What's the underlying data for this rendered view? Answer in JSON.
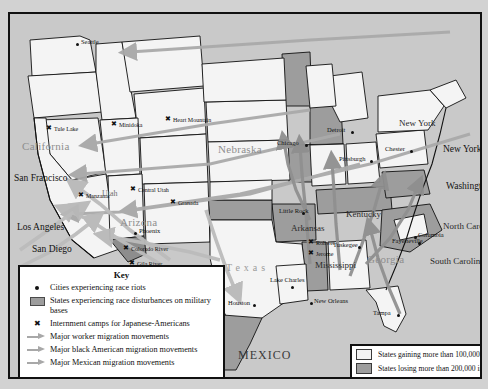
{
  "map": {
    "title": "United States wartime migration and racial unrest map",
    "background_color": "#c9c9c9",
    "border_color": "#111111",
    "state_fill_light": "#f2f2f2",
    "state_fill_gain": "#f2f2f2",
    "state_fill_loss": "#9d9d9d",
    "ocean_color": "#c9c9c9",
    "arrow_worker_color": "#a8a8a8",
    "arrow_black_color": "#8f8f8f",
    "arrow_mexican_color": "#b5b5b5"
  },
  "key": {
    "title": "Key",
    "items": [
      {
        "symbol": "filled-square",
        "label": "Cities experiencing race riots"
      },
      {
        "symbol": "gray-swatch",
        "label": "States experiencing race disturbances on military bases"
      },
      {
        "symbol": "star-square",
        "label": "Internment camps for Japanese-Americans"
      },
      {
        "symbol": "arrow",
        "label": "Major worker migration movements"
      },
      {
        "symbol": "arrow",
        "label": "Major black American migration movements"
      },
      {
        "symbol": "arrow",
        "label": "Major Mexican migration movements"
      }
    ]
  },
  "population_legend": {
    "items": [
      {
        "swatch_color": "#f2f2f2",
        "label": "States gaining more than 100,000 in population"
      },
      {
        "swatch_color": "#9d9d9d",
        "label": "States losing more than 200,000 in population"
      }
    ]
  },
  "cities": [
    {
      "name": "Seattle",
      "x": 66,
      "y": 29,
      "size": "small",
      "dot": true,
      "dx": 5,
      "dy": -4
    },
    {
      "name": "San Francisco",
      "x": 4,
      "y": 160,
      "size": "big",
      "dot": false,
      "dx": 0,
      "dy": 0
    },
    {
      "name": "Los Angeles",
      "x": 7,
      "y": 209,
      "size": "big",
      "dot": false,
      "dx": 0,
      "dy": 0
    },
    {
      "name": "San Diego",
      "x": 22,
      "y": 231,
      "size": "big",
      "dot": false,
      "dx": 0,
      "dy": 0
    },
    {
      "name": "Phoenix",
      "x": 124,
      "y": 218,
      "size": "small",
      "dot": true,
      "dx": 5,
      "dy": -4
    },
    {
      "name": "Chicago",
      "x": 295,
      "y": 130,
      "size": "small",
      "dot": true,
      "dx": -28,
      "dy": -4
    },
    {
      "name": "Detroit",
      "x": 341,
      "y": 117,
      "size": "small",
      "dot": true,
      "dx": -24,
      "dy": -4
    },
    {
      "name": "Pittsburgh",
      "x": 360,
      "y": 146,
      "size": "small",
      "dot": true,
      "dx": -31,
      "dy": -4
    },
    {
      "name": "Chester",
      "x": 400,
      "y": 136,
      "size": "small",
      "dot": true,
      "dx": -25,
      "dy": -4
    },
    {
      "name": "New York",
      "x": 433,
      "y": 131,
      "size": "big",
      "dot": false,
      "dx": 0,
      "dy": 0
    },
    {
      "name": "Washington",
      "x": 436,
      "y": 168,
      "size": "big",
      "dot": false,
      "dx": 0,
      "dy": 0
    },
    {
      "name": "Fayetteville",
      "x": 408,
      "y": 228,
      "size": "small",
      "dot": true,
      "dx": -26,
      "dy": -4
    },
    {
      "name": "Columbia",
      "x": 404,
      "y": 222,
      "size": "small",
      "dot": true,
      "dx": 4,
      "dy": -4
    },
    {
      "name": "Little Rock",
      "x": 292,
      "y": 198,
      "size": "small",
      "dot": true,
      "dx": -23,
      "dy": -4
    },
    {
      "name": "Tuskegee",
      "x": 348,
      "y": 232,
      "size": "small",
      "dot": true,
      "dx": -25,
      "dy": -4
    },
    {
      "name": "Lake Charles",
      "x": 281,
      "y": 272,
      "size": "small",
      "dot": true,
      "dx": -21,
      "dy": -9
    },
    {
      "name": "New Orleans",
      "x": 300,
      "y": 288,
      "size": "small",
      "dot": true,
      "dx": 4,
      "dy": -4
    },
    {
      "name": "Houston",
      "x": 243,
      "y": 290,
      "size": "small",
      "dot": true,
      "dx": -25,
      "dy": -4
    },
    {
      "name": "Tampa",
      "x": 387,
      "y": 300,
      "size": "small",
      "dot": true,
      "dx": -24,
      "dy": -4
    }
  ],
  "internment_camps": [
    {
      "name": "Tule Lake",
      "x": 36,
      "y": 111
    },
    {
      "name": "Minidoka",
      "x": 101,
      "y": 107
    },
    {
      "name": "Heart Mountain",
      "x": 155,
      "y": 102
    },
    {
      "name": "Manzanar",
      "x": 68,
      "y": 178
    },
    {
      "name": "Central Utah",
      "x": 120,
      "y": 172
    },
    {
      "name": "Granada",
      "x": 160,
      "y": 185
    },
    {
      "name": "Colorado River",
      "x": 113,
      "y": 231
    },
    {
      "name": "Gila River",
      "x": 119,
      "y": 246
    },
    {
      "name": "Rohwer",
      "x": 298,
      "y": 225
    },
    {
      "name": "Jerome",
      "x": 298,
      "y": 236
    }
  ],
  "state_labels": [
    {
      "name": "California",
      "x": 12,
      "y": 127,
      "style": "state-big"
    },
    {
      "name": "Nebraska",
      "x": 208,
      "y": 130,
      "style": "state-big"
    },
    {
      "name": "Arizona",
      "x": 110,
      "y": 203,
      "style": "state-big"
    },
    {
      "name": "Utah",
      "x": 92,
      "y": 176,
      "style": "state-med"
    },
    {
      "name": "Kentucky",
      "x": 336,
      "y": 196,
      "style": "state-dk"
    },
    {
      "name": "Arkansas",
      "x": 281,
      "y": 210,
      "style": "state-dk"
    },
    {
      "name": "Mississippi",
      "x": 305,
      "y": 247,
      "style": "state-dk"
    },
    {
      "name": "Georgia",
      "x": 357,
      "y": 240,
      "style": "state-big"
    },
    {
      "name": "New York",
      "x": 389,
      "y": 105,
      "style": "state-dk"
    },
    {
      "name": "North Carolina",
      "x": 433,
      "y": 208,
      "style": "state-dk"
    },
    {
      "name": "South Carolina",
      "x": 420,
      "y": 243,
      "style": "state-dk"
    },
    {
      "name": "Texas",
      "x": 216,
      "y": 249,
      "style": "tex"
    },
    {
      "name": "MEXICO",
      "x": 228,
      "y": 335,
      "style": "mex"
    }
  ],
  "chart_data": {
    "type": "map",
    "legend_position": "bottom-left and bottom-right",
    "categories": [
      "States gaining more than 100,000 in population",
      "States losing more than 200,000 in population"
    ],
    "annotations": [
      "Major worker migration movements",
      "Major black American migration movements",
      "Major Mexican migration movements"
    ]
  }
}
